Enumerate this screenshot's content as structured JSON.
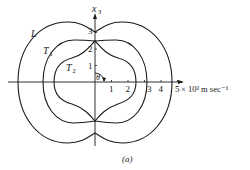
{
  "figure": {
    "caption": "(a)",
    "axes": {
      "vertical_label": "x",
      "vertical_label_sub": "3",
      "horizontal_unit": "× 10³ m sec⁻¹",
      "horizontal_ticks": [
        "1",
        "2",
        "3",
        "4",
        "5"
      ],
      "vertical_ticks": [
        "1",
        "2",
        "3"
      ],
      "angle_label": "θ"
    },
    "curves": [
      {
        "name": "L",
        "label": "L",
        "sub": ""
      },
      {
        "name": "T1",
        "label": "T",
        "sub": "1"
      },
      {
        "name": "T2",
        "label": "T",
        "sub": "2"
      }
    ]
  }
}
